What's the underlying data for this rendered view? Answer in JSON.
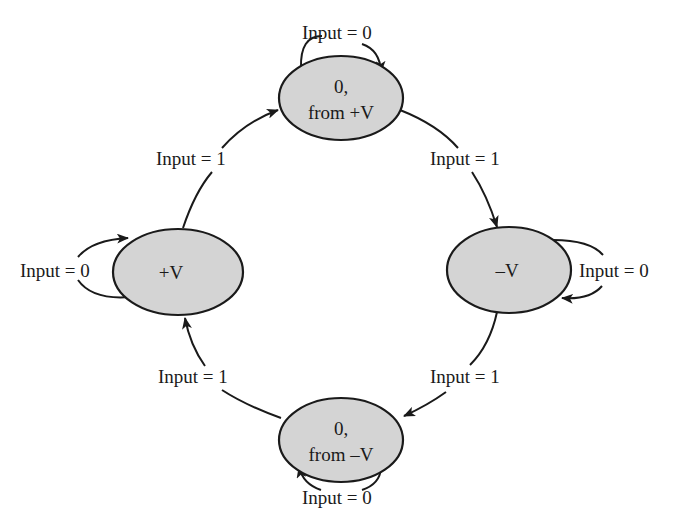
{
  "diagram": {
    "type": "state-machine",
    "colors": {
      "node_fill": "#d4d4d4",
      "stroke": "#1a1a1a",
      "background": "#ffffff"
    },
    "nodes": [
      {
        "id": "zero_from_pos",
        "line1": "0,",
        "line2": "from +V"
      },
      {
        "id": "neg_v",
        "label": "–V"
      },
      {
        "id": "zero_from_neg",
        "line1": "0,",
        "line2": "from –V"
      },
      {
        "id": "pos_v",
        "label": "+V"
      }
    ],
    "edges": [
      {
        "from": "zero_from_pos",
        "to": "zero_from_pos",
        "label": "Input = 0"
      },
      {
        "from": "zero_from_pos",
        "to": "neg_v",
        "label": "Input = 1"
      },
      {
        "from": "neg_v",
        "to": "neg_v",
        "label": "Input = 0"
      },
      {
        "from": "neg_v",
        "to": "zero_from_neg",
        "label": "Input = 1"
      },
      {
        "from": "zero_from_neg",
        "to": "zero_from_neg",
        "label": "Input = 0"
      },
      {
        "from": "zero_from_neg",
        "to": "pos_v",
        "label": "Input = 1"
      },
      {
        "from": "pos_v",
        "to": "pos_v",
        "label": "Input = 0"
      },
      {
        "from": "pos_v",
        "to": "zero_from_pos",
        "label": "Input = 1"
      }
    ]
  }
}
